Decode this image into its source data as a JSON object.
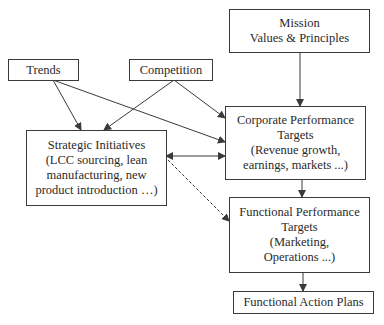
{
  "nodes": {
    "mission": {
      "lines": [
        "Mission",
        "Values & Principles"
      ]
    },
    "trends": {
      "lines": [
        "Trends"
      ]
    },
    "competition": {
      "lines": [
        "Competition"
      ]
    },
    "strategic": {
      "lines": [
        "Strategic Initiatives",
        "(LCC sourcing, lean",
        "manufacturing, new",
        "product introduction …)"
      ]
    },
    "corporate": {
      "lines": [
        "Corporate Performance",
        "Targets",
        "(Revenue growth,",
        "earnings, markets ...)"
      ]
    },
    "functional_targets": {
      "lines": [
        "Functional Performance",
        "Targets",
        "(Marketing,",
        "Operations ...)"
      ]
    },
    "action_plans": {
      "lines": [
        "Functional Action Plans"
      ]
    }
  },
  "edges": [
    {
      "from": "mission",
      "to": "corporate",
      "style": "solid"
    },
    {
      "from": "trends",
      "to": "strategic",
      "style": "solid"
    },
    {
      "from": "trends",
      "to": "corporate",
      "style": "solid"
    },
    {
      "from": "competition",
      "to": "strategic",
      "style": "solid"
    },
    {
      "from": "competition",
      "to": "corporate",
      "style": "solid"
    },
    {
      "from": "strategic",
      "to": "corporate",
      "style": "solid-bidirectional"
    },
    {
      "from": "strategic",
      "to": "functional_targets",
      "style": "dashed"
    },
    {
      "from": "corporate",
      "to": "functional_targets",
      "style": "solid"
    },
    {
      "from": "functional_targets",
      "to": "action_plans",
      "style": "solid"
    }
  ],
  "colors": {
    "line": "#3a3a3a",
    "text": "#2a2a2a",
    "background": "#ffffff"
  }
}
